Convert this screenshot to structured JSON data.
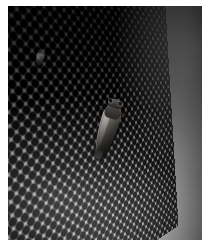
{
  "image": {
    "kind": "photograph",
    "medium": "black-and-white photograph",
    "caption": "A cicada-like insect clinging to a curved perforated metal mesh screen",
    "orientation": "portrait",
    "width_px": 212,
    "height_px": 248,
    "border": {
      "color": "#ffffff",
      "top_px": 6,
      "left_px": 8,
      "right_px": 10,
      "bottom_px": 8
    },
    "palette": {
      "darkest": "#1d1d1d",
      "shadow": "#333333",
      "midtone": "#6a6a6a",
      "highlight": "#bdbdbd",
      "lightest": "#c6c6c6",
      "border_white": "#ffffff",
      "insect_dark": "#232120",
      "insect_light": "#8f8b85"
    }
  },
  "subjects": {
    "insect": {
      "label": "insect",
      "common_name": "cicada",
      "position": {
        "x_px": 98,
        "y_px": 100
      },
      "size": {
        "width_px": 34,
        "height_px": 62
      },
      "rotation_deg": 17,
      "pose": "head up, body angled down-left, clinging to mesh",
      "parts": [
        "head",
        "compound eyes",
        "thorax",
        "folded wings",
        "abdomen tip",
        "legs"
      ]
    },
    "secondary_speck": {
      "label": "faint second insect",
      "position": {
        "x_px": 34,
        "y_px": 50
      },
      "size": {
        "width_px": 14,
        "height_px": 17
      }
    }
  },
  "background": {
    "label": "perforated mesh screen",
    "pattern": "hexagonally-offset round perforations",
    "cell_pitch_px": 11.2,
    "hole_radius_px": 3.05,
    "surface": "convex cylindrical, receding to the right",
    "perspective": {
      "rotate_y_deg": 31,
      "rotate_z_deg": -6.2
    },
    "lighting": "dark at top, progressively brighter toward bottom-left"
  }
}
